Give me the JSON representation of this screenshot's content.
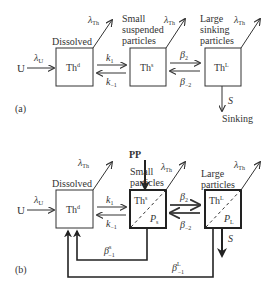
{
  "panel_a": {
    "label": "(a)",
    "input": "U",
    "input_rate": "λ",
    "input_rate_sub": "U",
    "decay": "λ",
    "decay_sub": "Th",
    "dissolved": {
      "heading": "Dissolved",
      "symbol": "Th",
      "sup": "d"
    },
    "small": {
      "heading_lines": [
        "Small",
        "suspended",
        "particles"
      ],
      "symbol": "Th",
      "sup": "s"
    },
    "large": {
      "heading_lines": [
        "Large",
        "sinking",
        "particles"
      ],
      "symbol": "Th",
      "sup": "L"
    },
    "k1": "k",
    "k1_sub": "1",
    "k_1": "k",
    "k_1_sub": "−1",
    "b2": "β",
    "b2_sub": "2",
    "b_2": "β",
    "b_2_sub": "−2",
    "sink_symbol": "S",
    "sink_label": "Sinking"
  },
  "panel_b": {
    "label": "(b)",
    "input": "U",
    "input_rate": "λ",
    "input_rate_sub": "U",
    "decay": "λ",
    "decay_sub": "Th",
    "pp": "PP",
    "dissolved": {
      "heading": "Dissolved",
      "symbol": "Th",
      "sup": "d"
    },
    "small": {
      "heading_lines": [
        "Small",
        "particles"
      ],
      "symbol": "Th",
      "sup": "s",
      "p": "P",
      "p_sub": "s"
    },
    "large": {
      "heading_lines": [
        "Large",
        "particles"
      ],
      "symbol": "Th",
      "sup": "L",
      "p": "P",
      "p_sub": "L"
    },
    "k1": "k",
    "k1_sub": "1",
    "k_1": "k",
    "k_1_sub": "−1",
    "b2": "β",
    "b2_sub": "2",
    "b_2": "β",
    "b_2_sub": "−2",
    "bs": "β",
    "bs_sup": "s",
    "bs_sub": "−1",
    "bL": "β",
    "bL_sup": "L",
    "bL_sub": "−1",
    "sink_symbol": "S"
  }
}
